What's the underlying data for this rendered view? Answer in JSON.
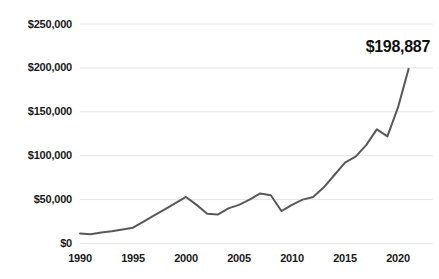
{
  "chart_data": {
    "type": "line",
    "title": "",
    "xlabel": "",
    "ylabel": "",
    "xlim": [
      1990,
      2021
    ],
    "ylim": [
      0,
      250000
    ],
    "grid": true,
    "legend": false,
    "y_ticks": [
      0,
      50000,
      100000,
      150000,
      200000,
      250000
    ],
    "y_tick_labels": [
      "$0",
      "$50,000",
      "$100,000",
      "$150,000",
      "$200,000",
      "$250,000"
    ],
    "x_ticks": [
      1990,
      1995,
      2000,
      2005,
      2010,
      2015,
      2020
    ],
    "x_tick_labels": [
      "1990",
      "1995",
      "2000",
      "2005",
      "2010",
      "2015",
      "2020"
    ],
    "annotations": [
      {
        "text": "$198,887",
        "x": 2021,
        "y": 198887
      }
    ],
    "line_color": "#595959",
    "grid_color": "#e4e4e4",
    "x": [
      1990,
      1991,
      1992,
      1993,
      1994,
      1995,
      1996,
      1997,
      1998,
      1999,
      2000,
      2001,
      2002,
      2003,
      2004,
      2005,
      2006,
      2007,
      2008,
      2009,
      2010,
      2011,
      2012,
      2013,
      2014,
      2015,
      2016,
      2017,
      2018,
      2019,
      2020,
      2021
    ],
    "values": [
      11500,
      10500,
      12500,
      14000,
      16000,
      18000,
      25000,
      32000,
      39000,
      46000,
      53000,
      44000,
      34000,
      33000,
      40000,
      44000,
      50000,
      57000,
      55000,
      37000,
      44000,
      50000,
      53000,
      64000,
      78000,
      92000,
      99000,
      112000,
      130000,
      122000,
      155000,
      198887
    ]
  }
}
